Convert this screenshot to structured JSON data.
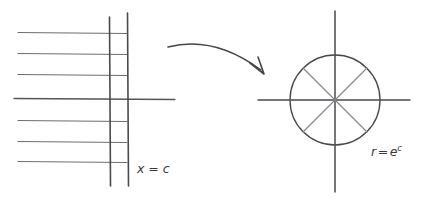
{
  "figure": {
    "background_color": "#ffffff",
    "ink_color": "#4a4a4c",
    "ink_color_light": "#7b7b7e",
    "width": 427,
    "height": 205
  },
  "left_panel": {
    "name": "z-plane vertical line family",
    "label": {
      "variable": "x",
      "equals": "=",
      "value": "c",
      "full_text": "x = c",
      "x": 137,
      "y": 173
    },
    "horizontal_lines": [
      {
        "x1": 18,
        "y1": 32,
        "x2": 127,
        "y2": 33
      },
      {
        "x1": 18,
        "y1": 53,
        "x2": 127,
        "y2": 54
      },
      {
        "x1": 18,
        "y1": 74,
        "x2": 127,
        "y2": 75
      },
      {
        "x1": 14,
        "y1": 98,
        "x2": 175,
        "y2": 99
      },
      {
        "x1": 18,
        "y1": 120,
        "x2": 127,
        "y2": 121
      },
      {
        "x1": 18,
        "y1": 141,
        "x2": 127,
        "y2": 142
      },
      {
        "x1": 18,
        "y1": 161,
        "x2": 127,
        "y2": 162
      }
    ],
    "vertical_lines": [
      {
        "x1": 109,
        "y1": 17,
        "x2": 110,
        "y2": 186
      },
      {
        "x1": 127,
        "y1": 13,
        "x2": 128,
        "y2": 186
      }
    ]
  },
  "arrow": {
    "name": "mapping arrow",
    "path": "M 168 47 Q 214 36 262 71",
    "head": "M 252 64 L 264 74 L 259 59"
  },
  "right_panel": {
    "name": "w-plane circle",
    "label": {
      "variable": "r",
      "equals": "=",
      "base": "e",
      "exponent": "c",
      "full_text": "r = e^c",
      "x": 371,
      "y": 156
    },
    "circle": {
      "cx": 335,
      "cy": 100,
      "r": 45
    },
    "axes": {
      "vertical": {
        "x1": 335,
        "y1": 11,
        "x2": 335,
        "y2": 192
      },
      "horizontal": {
        "x1": 258,
        "y1": 100,
        "x2": 410,
        "y2": 100
      }
    },
    "chords": [
      {
        "x1": 303,
        "y1": 68,
        "x2": 367,
        "y2": 132
      },
      {
        "x1": 303,
        "y1": 132,
        "x2": 367,
        "y2": 68
      }
    ]
  }
}
